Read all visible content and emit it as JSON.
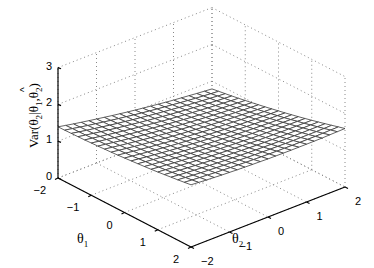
{
  "chart_data": {
    "type": "surface",
    "title": "",
    "xlabel": "θ1",
    "ylabel": "θ2",
    "zlabel": "Var(θ̂2|θ1,θ2)",
    "zlabel_parts": {
      "main": "Var(θ",
      "hat_sub": "2",
      "mid": "|θ",
      "s1": "1",
      "comma": ",θ",
      "s2": "2",
      "close": ")"
    },
    "xlim": [
      -2,
      2
    ],
    "ylim": [
      -2,
      2
    ],
    "zlim": [
      0,
      3
    ],
    "xticks": [
      "-2",
      "-1",
      "0",
      "1",
      "2"
    ],
    "yticks": [
      "-2",
      "-1",
      "0",
      "1",
      "2"
    ],
    "zticks": [
      "0",
      "1",
      "2",
      "3"
    ],
    "grid": true,
    "mesh_resolution": 21,
    "surface_corner_values": {
      "theta1_-2_theta2_-2": 1.3,
      "theta1_2_theta2_-2": 1.6,
      "theta1_-2_theta2_2": 0.7,
      "theta1_2_theta2_2": 1.5
    },
    "colors": {
      "mesh": "#3a3a3a",
      "grid": "#888888",
      "axis": "#000000"
    }
  }
}
